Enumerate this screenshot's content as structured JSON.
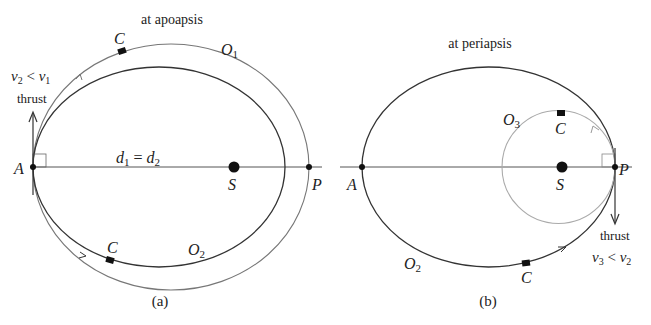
{
  "panel_a": {
    "title": "at apoapsis",
    "caption": "(a)",
    "points": {
      "A": "A",
      "S": "S",
      "P": "P"
    },
    "orbit_outer_label": "O",
    "orbit_outer_sub": "1",
    "orbit_inner_label": "O",
    "orbit_inner_sub": "2",
    "craft_top": "C",
    "craft_bottom": "C",
    "distance_eq": {
      "d1": "d",
      "d1_sub": "1",
      "eq": " = ",
      "d2": "d",
      "d2_sub": "2"
    },
    "velocity": {
      "v2": "v",
      "v2_sub": "2",
      "lt": " < ",
      "v1": "v",
      "v1_sub": "1"
    },
    "thrust_label": "thrust"
  },
  "panel_b": {
    "title": "at periapsis",
    "caption": "(b)",
    "points": {
      "A": "A",
      "S": "S",
      "P": "P"
    },
    "orbit_ellipse_label": "O",
    "orbit_ellipse_sub": "2",
    "orbit_circle_label": "O",
    "orbit_circle_sub": "3",
    "craft_top": "C",
    "craft_bottom": "C",
    "velocity": {
      "v3": "v",
      "v3_sub": "3",
      "lt": " < ",
      "v2": "v",
      "v2_sub": "2"
    },
    "thrust_label": "thrust"
  },
  "colors": {
    "dark_orbit": "#333333",
    "light_orbit": "#888888",
    "circle_orbit": "#aaaaaa",
    "ink": "#222222"
  }
}
